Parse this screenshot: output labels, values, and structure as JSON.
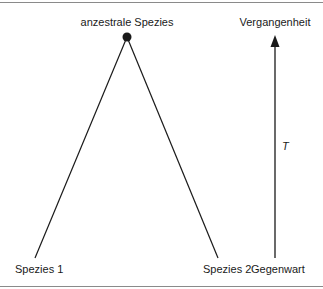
{
  "diagram": {
    "type": "phylogenetic-tree",
    "nodes": {
      "ancestor": {
        "label": "anzestrale Spezies",
        "x": 127,
        "y": 37
      },
      "species1": {
        "label": "Spezies 1",
        "x": 35,
        "y": 258
      },
      "species2": {
        "label": "Spezies 2",
        "x": 218,
        "y": 258
      }
    },
    "edges": [
      {
        "from": "ancestor",
        "to": "species1"
      },
      {
        "from": "ancestor",
        "to": "species2"
      }
    ],
    "time_axis": {
      "top_label": "Vergangenheit",
      "bottom_label": "Gegenwart",
      "axis_label": "T",
      "x": 275,
      "y_top": 36,
      "y_bottom": 258,
      "direction": "up"
    },
    "colors": {
      "line": "#1a1a1a",
      "rule": "#8a8a8a",
      "background": "#ffffff"
    }
  }
}
